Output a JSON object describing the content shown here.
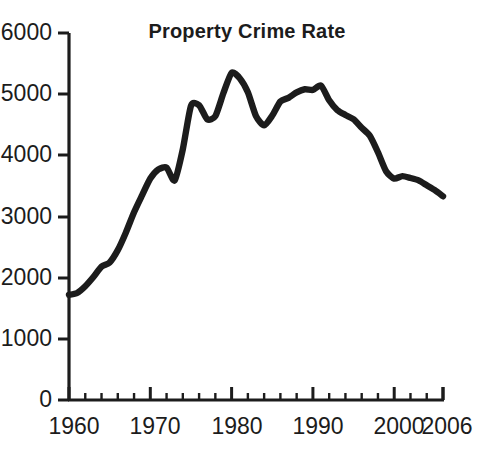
{
  "chart_data": {
    "type": "line",
    "title": "Property Crime Rate",
    "xlabel": "",
    "ylabel": "",
    "grid": false,
    "legend": false,
    "legend_position": "none",
    "line_color": "#1c1c1c",
    "background_color": "#ffffff",
    "xlim": [
      1960,
      2006
    ],
    "ylim": [
      0,
      6000
    ],
    "y_ticks": [
      0,
      1000,
      2000,
      3000,
      4000,
      5000,
      6000
    ],
    "y_tick_labels": [
      "0",
      "1000",
      "2000",
      "3000",
      "4000",
      "5000",
      "6000"
    ],
    "x_ticks": [
      1960,
      1970,
      1980,
      1990,
      2000,
      2006
    ],
    "x_tick_labels": [
      "1960",
      "1970",
      "1980",
      "1990",
      "2000",
      "2006"
    ],
    "x_minor_tick_interval": 2,
    "series": [
      {
        "name": "Property Crime Rate",
        "x": [
          1960,
          1961,
          1962,
          1963,
          1964,
          1965,
          1966,
          1967,
          1968,
          1969,
          1970,
          1971,
          1972,
          1973,
          1974,
          1975,
          1976,
          1977,
          1978,
          1979,
          1980,
          1981,
          1982,
          1983,
          1984,
          1985,
          1986,
          1987,
          1988,
          1989,
          1990,
          1991,
          1992,
          1993,
          1994,
          1995,
          1996,
          1997,
          1998,
          1999,
          2000,
          2001,
          2002,
          2003,
          2004,
          2005,
          2006
        ],
        "values": [
          1720,
          1750,
          1860,
          2010,
          2180,
          2250,
          2450,
          2740,
          3070,
          3350,
          3620,
          3770,
          3800,
          3590,
          4100,
          4810,
          4820,
          4590,
          4640,
          5020,
          5350,
          5260,
          5030,
          4640,
          4490,
          4650,
          4880,
          4940,
          5030,
          5080,
          5070,
          5140,
          4900,
          4740,
          4660,
          4590,
          4450,
          4320,
          4050,
          3740,
          3620,
          3660,
          3630,
          3590,
          3510,
          3430,
          3330
        ]
      }
    ],
    "annotations": {
      "peak_year": 1980,
      "peak_value": 5350,
      "start_value": 1720,
      "end_value": 3330
    }
  },
  "axes": {
    "y_axis_name": "value-axis",
    "x_axis_name": "year-axis"
  }
}
